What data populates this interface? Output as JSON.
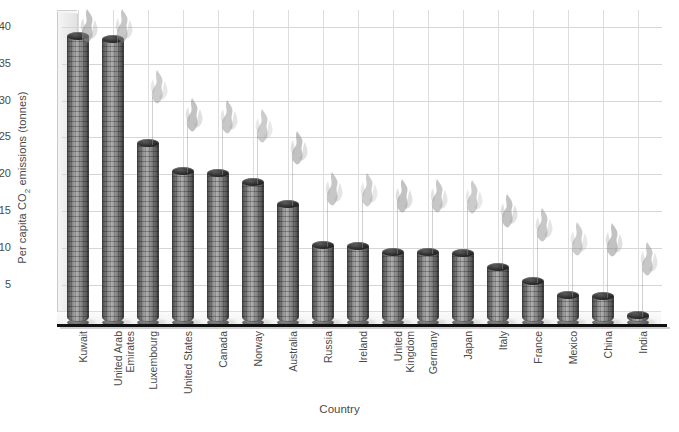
{
  "chart_data": {
    "type": "bar",
    "title": "",
    "xlabel": "Country",
    "ylabel": "Per capita CO2 emissions (tonnes)",
    "ylabel_parts": {
      "pre": "Per capita CO",
      "sub": "2",
      "post": " emissions (tonnes)"
    },
    "ylim": [
      0,
      42
    ],
    "yticks": [
      5,
      10,
      15,
      20,
      25,
      30,
      35,
      40
    ],
    "grid": true,
    "legend": "none",
    "style": "3d-chimney-bars-with-smoke",
    "categories": [
      "Kuwait",
      "United Arab\nEmirates",
      "Luxembourg",
      "United States",
      "Canada",
      "Norway",
      "Australia",
      "Russia",
      "Ireland",
      "United Kingdom",
      "Germany",
      "Japan",
      "Italy",
      "France",
      "Mexico",
      "China",
      "India"
    ],
    "values": [
      38.8,
      38.3,
      24.3,
      20.5,
      20.2,
      19.0,
      16.0,
      10.5,
      10.3,
      9.5,
      9.5,
      9.4,
      7.5,
      5.5,
      3.7,
      3.5,
      1.0
    ]
  },
  "colors": {
    "baseline": "#111111",
    "gridline": "#d6d6d6",
    "text": "#4a4a4a",
    "bar_light": "#b0b0b0",
    "bar_dark": "#3f3f3f",
    "smoke": "#9a9a9a",
    "wall": "#ededed",
    "background": "#ffffff"
  }
}
